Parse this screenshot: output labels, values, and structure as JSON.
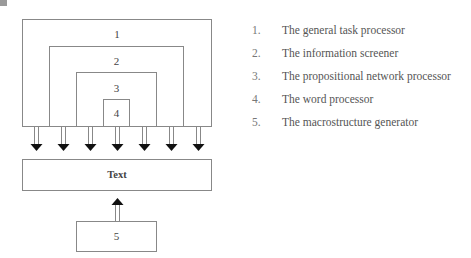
{
  "diagram": {
    "boxes": [
      {
        "id": "1",
        "label": "1"
      },
      {
        "id": "2",
        "label": "2"
      },
      {
        "id": "3",
        "label": "3"
      },
      {
        "id": "4",
        "label": "4"
      }
    ],
    "text_box": {
      "label": "Text"
    },
    "generator_box": {
      "label": "5"
    },
    "down_arrow_count": 7
  },
  "legend": {
    "items": [
      {
        "number": "1.",
        "text": "The general task processor"
      },
      {
        "number": "2.",
        "text": "The information screener"
      },
      {
        "number": "3.",
        "text": "The propositional network processor"
      },
      {
        "number": "4.",
        "text": "The word processor"
      },
      {
        "number": "5.",
        "text": "The macrostructure generator"
      }
    ]
  },
  "colors": {
    "line": "#888888",
    "arrowhead": "#111111",
    "text": "#444444"
  }
}
